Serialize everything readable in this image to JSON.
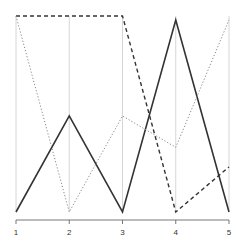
{
  "chart_data": {
    "type": "line",
    "subtype": "parallel-coordinates",
    "title": "",
    "xlabel": "",
    "ylabel": "",
    "categories": [
      "1",
      "2",
      "3",
      "4",
      "5"
    ],
    "ylim": [
      0,
      1
    ],
    "grid": false,
    "legend": null,
    "series": [
      {
        "name": "solid",
        "style": "solid",
        "color": "#333333",
        "width": 1.6,
        "values": [
          0,
          0.49,
          0,
          0.98,
          0
        ]
      },
      {
        "name": "dashed",
        "style": "dashed",
        "color": "#333333",
        "width": 1.4,
        "values": [
          1,
          1,
          1,
          0,
          0.23
        ]
      },
      {
        "name": "dotted",
        "style": "dotted",
        "color": "#888888",
        "width": 1.0,
        "values": [
          1,
          0,
          0.49,
          0.33,
          0.98
        ]
      }
    ]
  },
  "axis": {
    "tick_labels": [
      "1",
      "2",
      "3",
      "4",
      "5"
    ],
    "vertical_line_color": "#cccccc",
    "axis_color": "#555555"
  }
}
